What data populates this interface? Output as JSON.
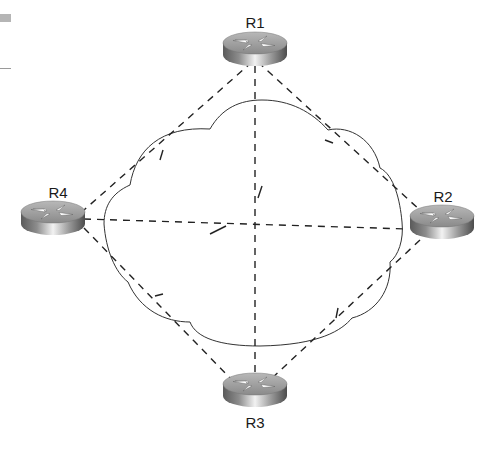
{
  "diagram": {
    "type": "full-mesh network topology",
    "cloud": "WAN / Frame Relay cloud",
    "routers": [
      {
        "id": "R1",
        "label": "R1",
        "x": 255,
        "y": 52
      },
      {
        "id": "R2",
        "label": "R2",
        "x": 440,
        "y": 222
      },
      {
        "id": "R3",
        "label": "R3",
        "x": 255,
        "y": 388
      },
      {
        "id": "R4",
        "label": "R4",
        "x": 52,
        "y": 218
      }
    ],
    "links": [
      {
        "from": "R1",
        "to": "R2",
        "style": "dashed"
      },
      {
        "from": "R1",
        "to": "R3",
        "style": "dashed"
      },
      {
        "from": "R1",
        "to": "R4",
        "style": "dashed"
      },
      {
        "from": "R2",
        "to": "R3",
        "style": "dashed"
      },
      {
        "from": "R2",
        "to": "R4",
        "style": "dashed"
      },
      {
        "from": "R3",
        "to": "R4",
        "style": "dashed"
      }
    ]
  }
}
